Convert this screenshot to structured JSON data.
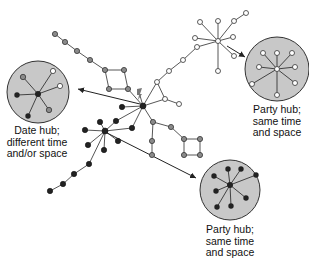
{
  "colors": {
    "background": "#ffffff",
    "edge": "#333333",
    "circle_fill": "#c8c8c8",
    "circle_stroke": "#333333",
    "node_black": "#222222",
    "node_gray": "#8a8a8a",
    "node_white": "#ffffff"
  },
  "labels": {
    "date_hub": [
      "Date hub;",
      "different time",
      "and/or space"
    ],
    "party_hub_top": [
      "Party hub;",
      "same time",
      "and space"
    ],
    "party_hub_bottom": [
      "Party hub;",
      "same time",
      "and space"
    ]
  },
  "legend_note": "Node shading indicates expression/timing group (black, gray, white)"
}
